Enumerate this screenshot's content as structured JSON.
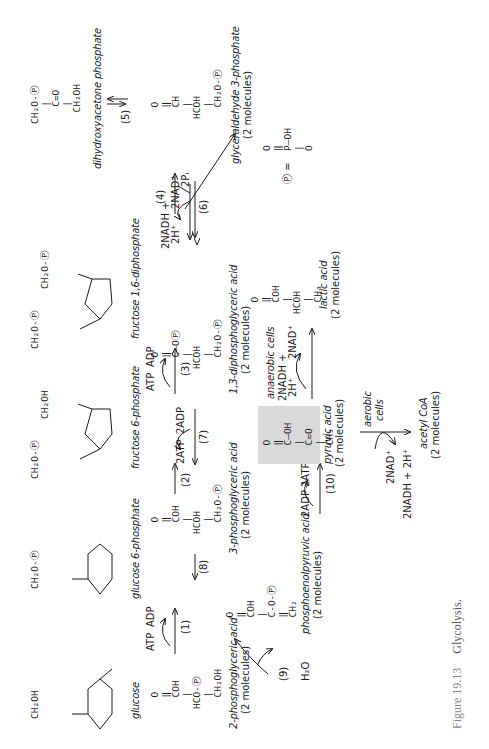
{
  "figure": {
    "number": "Figure 19.13",
    "title": "Glycolysis."
  },
  "compounds": {
    "glucose": {
      "name": "glucose",
      "formula_top": "CH₂OH",
      "ring_labels": [
        "O",
        "OH",
        "HO",
        "OH",
        "OH"
      ]
    },
    "glucose6p": {
      "name": "glucose 6-phosphate",
      "formula_top": "CH₂O-Ⓟ",
      "ring_labels": [
        "O",
        "OH",
        "HO",
        "OH",
        "OH"
      ]
    },
    "fructose6p": {
      "name": "fructose 6-phosphate",
      "formula_top_left": "CH₂O-Ⓟ",
      "formula_top_right": "CH₂OH",
      "ring_labels": [
        "O",
        "OH",
        "OH",
        "OH"
      ]
    },
    "fructose16dp": {
      "name": "fructose 1,6-diphosphate",
      "formula_top_left": "CH₂O-Ⓟ",
      "formula_top_right": "CH₂O-Ⓟ",
      "ring_labels": [
        "O",
        "OH",
        "OH",
        "OH"
      ]
    },
    "dhap": {
      "name": "dihydroxyacetone phosphate",
      "lines": [
        "CH₂O-Ⓟ",
        "|",
        "C=O",
        "|",
        "CH₂OH"
      ]
    },
    "g3p": {
      "name": "glyceraldehyde 3-phosphate",
      "count": "(2 molecules)",
      "lines": [
        "O",
        "‖",
        "CH",
        "|",
        "HCOH",
        "|",
        "CH₂O-Ⓟ"
      ]
    },
    "bpg13": {
      "name": "1,3-diphosphoglyceric acid",
      "count": "(2 molecules)",
      "lines": [
        "O",
        "‖",
        "C—OⓅ",
        "|",
        "HCOH",
        "|",
        "CH₂O-Ⓟ"
      ]
    },
    "pg3": {
      "name": "3-phosphoglyceric acid",
      "count": "(2 molecules)",
      "lines": [
        "O",
        "‖",
        "COH",
        "|",
        "HCOH",
        "|",
        "CH₂O-Ⓟ"
      ]
    },
    "pg2": {
      "name": "2-phosphoglyceric acid",
      "count": "(2 molecules)",
      "lines": [
        "O",
        "‖",
        "COH",
        "|",
        "HCO-Ⓟ",
        "|",
        "CH₂OH"
      ]
    },
    "pep": {
      "name": "phosphoenolpyruvic acid",
      "count": "(2 molecules)",
      "lines": [
        "O",
        "‖",
        "COH",
        "|",
        "C-O-Ⓟ",
        "‖",
        "CH₂"
      ]
    },
    "pyruvate": {
      "name": "pyruvic acid",
      "count": "(2 molecules)",
      "lines": [
        "O",
        "‖",
        "C—OH",
        "|",
        "C=O",
        "|",
        "CH₃"
      ]
    },
    "lactate": {
      "name": "lactic acid",
      "count": "(2 molecules)",
      "lines": [
        "O",
        "‖",
        "COH",
        "|",
        "HCOH",
        "|",
        "CH₃"
      ]
    },
    "acetylcoa": {
      "name": "acetyl CoA",
      "count": "(2 molecules)"
    },
    "phosphate_def": {
      "symbol": "Ⓟ =",
      "lines": [
        "O",
        "‖",
        "P—OH",
        "|",
        "O"
      ]
    }
  },
  "steps": {
    "s1": {
      "label": "(1)",
      "in": "ATP",
      "out": "ADP"
    },
    "s2": {
      "label": "(2)"
    },
    "s3": {
      "label": "(3)",
      "in": "ATP",
      "out": "ADP"
    },
    "s4": {
      "label": "(4)"
    },
    "s5": {
      "label": "(5)"
    },
    "s6": {
      "label": "(6)",
      "in": "2NAD⁺",
      "in2": "2Pᵢ",
      "out": "2NADH +",
      "out2": "2H⁺"
    },
    "s7": {
      "label": "(7)",
      "in": "2ADP",
      "out": "2ATP"
    },
    "s8": {
      "label": "(8)"
    },
    "s9": {
      "label": "(9)",
      "out": "H₂O"
    },
    "s10": {
      "label": "(10)",
      "in": "2ADP",
      "out": "2ATP"
    },
    "anaerobic": {
      "label": "anaerobic cells",
      "in": "2NADH +",
      "in2": "2H⁺",
      "out": "2NAD⁺"
    },
    "aerobic": {
      "label": "aerobic",
      "label2": "cells",
      "in": "2NAD⁺",
      "out": "2NADH + 2H⁺"
    }
  }
}
